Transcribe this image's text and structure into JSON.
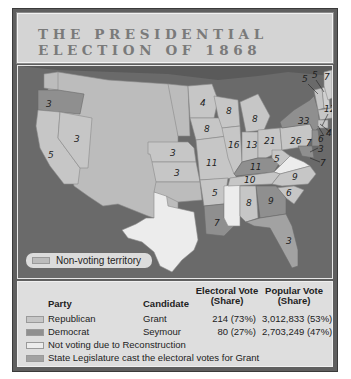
{
  "title": {
    "line1": "THE PRESIDENTIAL",
    "line2": "ELECTION OF 1868"
  },
  "colors": {
    "republican": "#c6c6c6",
    "democrat": "#8f8f8f",
    "not_voting": "#ececec",
    "legislature": "#a2a2a2",
    "territory": "#bcbcbc",
    "water": "#6a6a6a"
  },
  "map": {
    "state_labels": [
      {
        "state": "Oregon",
        "votes": "3"
      },
      {
        "state": "California",
        "votes": "5"
      },
      {
        "state": "Nevada",
        "votes": "3"
      },
      {
        "state": "Nebraska",
        "votes": "3"
      },
      {
        "state": "Kansas",
        "votes": "3"
      },
      {
        "state": "Minnesota",
        "votes": "4"
      },
      {
        "state": "Iowa",
        "votes": "8"
      },
      {
        "state": "Missouri",
        "votes": "11"
      },
      {
        "state": "Arkansas",
        "votes": "5"
      },
      {
        "state": "Louisiana",
        "votes": "7"
      },
      {
        "state": "Wisconsin",
        "votes": "8"
      },
      {
        "state": "Illinois",
        "votes": "16"
      },
      {
        "state": "Michigan",
        "votes": "8"
      },
      {
        "state": "Indiana",
        "votes": "13"
      },
      {
        "state": "Ohio",
        "votes": "21"
      },
      {
        "state": "Kentucky",
        "votes": "11"
      },
      {
        "state": "Tennessee",
        "votes": "10"
      },
      {
        "state": "Alabama",
        "votes": "8"
      },
      {
        "state": "Georgia",
        "votes": "9"
      },
      {
        "state": "South Carolina",
        "votes": "6"
      },
      {
        "state": "North Carolina",
        "votes": "9"
      },
      {
        "state": "Florida",
        "votes": "3"
      },
      {
        "state": "West Virginia",
        "votes": "5"
      },
      {
        "state": "Pennsylvania",
        "votes": "26"
      },
      {
        "state": "New York",
        "votes": "33"
      },
      {
        "state": "Vermont",
        "votes": "5"
      },
      {
        "state": "New Hampshire",
        "votes": "5"
      },
      {
        "state": "Maine",
        "votes": "7"
      },
      {
        "state": "Massachusetts",
        "votes": "12"
      },
      {
        "state": "Rhode Island",
        "votes": "4"
      },
      {
        "state": "Connecticut",
        "votes": "6"
      },
      {
        "state": "New Jersey",
        "votes": "7"
      },
      {
        "state": "Delaware",
        "votes": "3"
      },
      {
        "state": "Maryland",
        "votes": "7"
      }
    ],
    "territory_legend": "Non-voting territory"
  },
  "legend": {
    "headers": {
      "party": "Party",
      "candidate": "Candidate",
      "electoral": "Electoral Vote (Share)",
      "electoral_l1": "Electoral Vote",
      "electoral_l2": "(Share)",
      "popular_l1": "Popular Vote",
      "popular_l2": "(Share)"
    },
    "rows": [
      {
        "party": "Republican",
        "candidate": "Grant",
        "electoral": "214 (73%)",
        "popular": "3,012,833 (53%)"
      },
      {
        "party": "Democrat",
        "candidate": "Seymour",
        "electoral": "80 (27%)",
        "popular": "2,703,249 (47%)"
      },
      {
        "party": "Not voting due to Reconstruction"
      },
      {
        "party": "State Legislature cast the electoral votes for Grant"
      }
    ]
  }
}
